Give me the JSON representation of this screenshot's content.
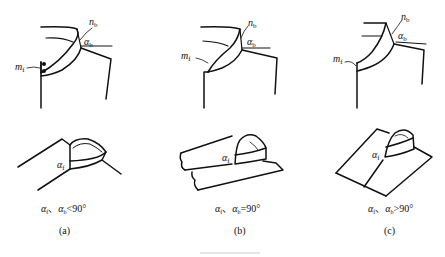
{
  "figure": {
    "panels": [
      {
        "id": "a",
        "label": "(a)",
        "top_labels": {
          "n": "n",
          "n_sub": "b",
          "alpha": "α",
          "alpha_sub": "b",
          "m": "m",
          "m_sub": "f"
        },
        "bottom_label": {
          "alpha": "α",
          "alpha_sub": "f"
        },
        "condition": {
          "a1": "α",
          "s1": "f",
          "sep": "、",
          "a2": "α",
          "s2": "b",
          "rel": "<90°"
        },
        "features": [
          "buttons"
        ]
      },
      {
        "id": "b",
        "label": "(b)",
        "top_labels": {
          "n": "n",
          "n_sub": "b",
          "alpha": "α",
          "alpha_sub": "b",
          "m": "m",
          "m_sub": "f"
        },
        "bottom_label": {
          "alpha": "α",
          "alpha_sub": "f"
        },
        "condition": {
          "a1": "α",
          "s1": "f",
          "sep": "、",
          "a2": "α",
          "s2": "b",
          "rel": "=90°"
        }
      },
      {
        "id": "c",
        "label": "(c)",
        "top_labels": {
          "n": "n",
          "n_sub": "b",
          "alpha": "α",
          "alpha_sub": "b",
          "m": "m",
          "m_sub": "f"
        },
        "bottom_label": {
          "alpha": "α",
          "alpha_sub": "f"
        },
        "condition": {
          "a1": "α",
          "s1": "f",
          "sep": "、",
          "a2": "α",
          "s2": "b",
          "rel": ">90°"
        }
      }
    ],
    "colors": {
      "line": "#111111",
      "thin_line": "#555555",
      "background": "#ffffff"
    }
  }
}
